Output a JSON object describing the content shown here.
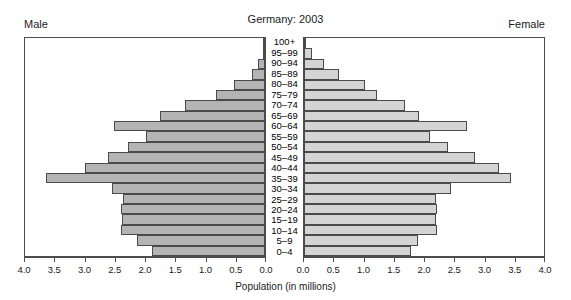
{
  "header": {
    "title": "Germany: 2003",
    "male_label": "Male",
    "female_label": "Female"
  },
  "axis": {
    "xlabel": "Population (in millions)",
    "tick_labels_left": [
      "4.0",
      "3.5",
      "3.0",
      "2.5",
      "2.0",
      "1.5",
      "1.0",
      "0.5",
      "0.0"
    ],
    "tick_labels_right": [
      "0.0",
      "0.5",
      "1.0",
      "1.5",
      "2.0",
      "2.5",
      "3.0",
      "3.5",
      "4.0"
    ],
    "tick_values": [
      4.0,
      3.5,
      3.0,
      2.5,
      2.0,
      1.5,
      1.0,
      0.5,
      0.0
    ]
  },
  "chart_data": {
    "type": "bar",
    "title": "Germany: 2003",
    "xlabel": "Population (in millions)",
    "ylabel": "",
    "xlim": [
      0,
      4.0
    ],
    "grid": false,
    "legend": [
      "Male",
      "Female"
    ],
    "legend_position": "top-left and top-right corners",
    "orientation": "horizontal-diverging-population-pyramid",
    "categories": [
      "100+",
      "95–99",
      "90–94",
      "85–89",
      "80–84",
      "75–79",
      "70–74",
      "65–69",
      "60–64",
      "55–59",
      "50–54",
      "45–49",
      "40–44",
      "35–39",
      "30–34",
      "25–29",
      "20–24",
      "15–19",
      "10–14",
      "5–9",
      "0–4"
    ],
    "series": [
      {
        "name": "Male",
        "direction": "left",
        "values": [
          0.01,
          0.04,
          0.11,
          0.22,
          0.52,
          0.82,
          1.33,
          1.75,
          2.52,
          1.98,
          2.28,
          2.62,
          3.0,
          3.65,
          2.55,
          2.37,
          2.4,
          2.38,
          2.4,
          2.13,
          1.89
        ]
      },
      {
        "name": "Female",
        "direction": "right",
        "values": [
          0.03,
          0.13,
          0.33,
          0.58,
          1.02,
          1.22,
          1.68,
          1.92,
          2.72,
          2.1,
          2.4,
          2.85,
          3.25,
          3.45,
          2.45,
          2.2,
          2.22,
          2.2,
          2.22,
          1.9,
          1.78
        ]
      }
    ]
  },
  "style": {
    "male_bar_color": "#b4b4b4",
    "female_bar_color": "#d4d4d4",
    "bar_border_color": "#4a4a4a",
    "axis_color": "#4d4d4d",
    "background": "#ffffff"
  }
}
